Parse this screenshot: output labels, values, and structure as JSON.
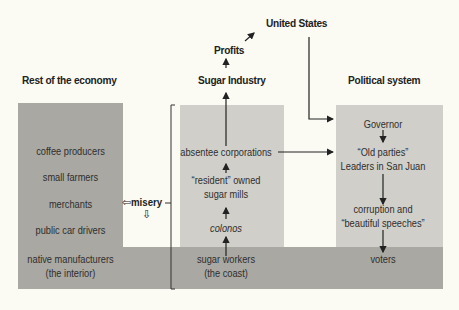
{
  "headers": {
    "united_states": "United States",
    "profits": "Profits",
    "sugar_industry": "Sugar Industry",
    "rest_economy": "Rest of the economy",
    "political_system": "Political system"
  },
  "rest_of_economy": {
    "items": [
      "coffee producers",
      "small farmers",
      "merchants",
      "public car drivers"
    ],
    "band_line1": "native manufacturers",
    "band_line2": "(the interior)"
  },
  "sugar_industry": {
    "absentee": "absentee corporations",
    "resident_line1": "“resident” owned",
    "resident_line2": "sugar mills",
    "colonos": "colonos",
    "workers_line1": "sugar workers",
    "workers_line2": "(the coast)"
  },
  "political_system": {
    "governor": "Governor",
    "parties_line1": "“Old parties”",
    "parties_line2": "Leaders in San Juan",
    "corruption_line1": "corruption and",
    "corruption_line2": "“beautiful speeches”",
    "voters": "voters"
  },
  "misery": {
    "label": "misery",
    "left_arrow": "⇦",
    "down_arrow": "⇩"
  },
  "colors": {
    "background": "#fbfaf3",
    "dark_gray": "#a9a8a2",
    "light_gray": "#d0cfc9",
    "ink": "#2a2a2a"
  }
}
